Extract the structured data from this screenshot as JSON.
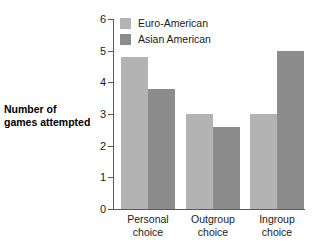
{
  "chart_data": {
    "type": "bar",
    "title": "",
    "subtitle": "",
    "xlabel": "",
    "ylabel": "Number of games attempted",
    "ylabel_line1": "Number of",
    "ylabel_line2": "games attempted",
    "ylim": [
      0,
      6
    ],
    "ytick_labels": [
      "0",
      "1",
      "2",
      "3",
      "4",
      "5",
      "6"
    ],
    "ytick_values": [
      0,
      1,
      2,
      3,
      4,
      5,
      6
    ],
    "grid": false,
    "legend_position": "inside-top-left",
    "categories": [
      "Personal choice",
      "Outgroup choice",
      "Ingroup choice"
    ],
    "category_lines": [
      {
        "line1": "Personal",
        "line2": "choice"
      },
      {
        "line1": "Outgroup",
        "line2": "choice"
      },
      {
        "line1": "Ingroup",
        "line2": "choice"
      }
    ],
    "series": [
      {
        "name": "Euro-American",
        "color": "#b3b3b3",
        "values": [
          4.8,
          3.0,
          3.0
        ]
      },
      {
        "name": "Asian American",
        "color": "#8c8c8c",
        "values": [
          3.8,
          2.6,
          5.0
        ]
      }
    ]
  },
  "colors": {
    "series_light": "#b3b3b3",
    "series_dark": "#8c8c8c",
    "axis": "#595959",
    "text": "#1a1a1a",
    "background": "#ffffff"
  }
}
